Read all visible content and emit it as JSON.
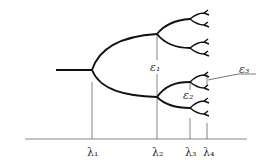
{
  "diagram": {
    "type": "bifurcation-tree",
    "colors": {
      "branch": "#111111",
      "axis": "#888888",
      "guide": "#777777",
      "text": "#333333"
    },
    "axis_labels": [
      {
        "id": "lambda1",
        "text": "λ₁",
        "x": 92
      },
      {
        "id": "lambda2",
        "text": "λ₂",
        "x": 157
      },
      {
        "id": "lambda3",
        "text": "λ₃",
        "x": 190
      },
      {
        "id": "lambda4",
        "text": "λ₄",
        "x": 207
      }
    ],
    "gap_labels": [
      {
        "id": "epsilon1",
        "text": "ε₁"
      },
      {
        "id": "epsilon2",
        "text": "ε₂"
      },
      {
        "id": "epsilon3",
        "text": "ε₃"
      }
    ]
  }
}
